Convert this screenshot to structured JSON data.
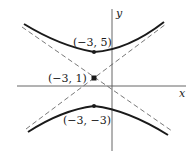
{
  "diagram": {
    "type": "hyperbola-graph",
    "axes": {
      "x_label": "x",
      "y_label": "y"
    },
    "points": [
      {
        "name": "upper-vertex",
        "label": "(−3, 5)"
      },
      {
        "name": "center",
        "label": "(−3, 1)"
      },
      {
        "name": "lower-vertex",
        "label": "(−3, −3)"
      }
    ],
    "asymptotes": "dashed",
    "colors": {
      "curve": "#1a1a1a",
      "axis": "#555555",
      "asymptote": "#555555"
    }
  }
}
